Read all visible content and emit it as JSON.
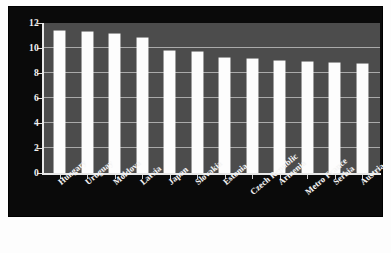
{
  "chart_data": {
    "type": "bar",
    "title": "",
    "subtitle": "",
    "xlabel": "",
    "ylabel": "",
    "ylim": [
      0,
      12
    ],
    "yticks": [
      0,
      2,
      4,
      6,
      8,
      10,
      12
    ],
    "ytick_labels": [
      "0",
      "2",
      "4",
      "6",
      "8",
      "10",
      "12"
    ],
    "grid": true,
    "legend": false,
    "legend_position": "none",
    "categories": [
      "Hungary",
      "Uruguay",
      "Moldova",
      "Latvia",
      "Japan",
      "Slovakia",
      "Estonia",
      "Czech Republic",
      "Armenia",
      "Metro France",
      "Serbia",
      "Austria"
    ],
    "values": [
      11.4,
      11.3,
      11.1,
      10.8,
      9.8,
      9.7,
      9.2,
      9.1,
      9.0,
      8.9,
      8.8,
      8.7
    ],
    "series": [
      {
        "name": "",
        "values": [
          11.4,
          11.3,
          11.1,
          10.8,
          9.8,
          9.7,
          9.2,
          9.1,
          9.0,
          8.9,
          8.8,
          8.7
        ]
      }
    ],
    "bar_color": "#fdfdfd",
    "plot_background": "#4c4c4c",
    "panel_background": "#0a0a0a",
    "gridline_color": "#c9c9c9",
    "axis_text_color": "#f2f2f2"
  }
}
